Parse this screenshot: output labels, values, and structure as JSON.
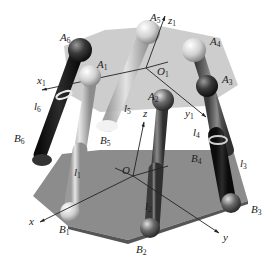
{
  "diagram": {
    "background": "#ffffff",
    "colors": {
      "top_platform": "#c9c9c9",
      "base_platform": "#8a8a8a",
      "dark_leg": "#1a1a1a",
      "mid_leg": "#5a5a5a",
      "light_leg": "#bdbdbd",
      "axis_line": "#222222"
    },
    "top_joints": [
      {
        "name": "A",
        "sub": "1"
      },
      {
        "name": "A",
        "sub": "2"
      },
      {
        "name": "A",
        "sub": "3"
      },
      {
        "name": "A",
        "sub": "4"
      },
      {
        "name": "A",
        "sub": "5"
      },
      {
        "name": "A",
        "sub": "6"
      }
    ],
    "base_joints": [
      {
        "name": "B",
        "sub": "1"
      },
      {
        "name": "B",
        "sub": "2"
      },
      {
        "name": "B",
        "sub": "3"
      },
      {
        "name": "B",
        "sub": "4"
      },
      {
        "name": "B",
        "sub": "5"
      },
      {
        "name": "B",
        "sub": "6"
      }
    ],
    "legs": [
      {
        "name": "l",
        "sub": "1"
      },
      {
        "name": "l",
        "sub": "2"
      },
      {
        "name": "l",
        "sub": "3"
      },
      {
        "name": "l",
        "sub": "4"
      },
      {
        "name": "l",
        "sub": "5"
      },
      {
        "name": "l",
        "sub": "6"
      }
    ],
    "moving_frame": {
      "origin": {
        "name": "O",
        "sub": "1"
      },
      "x": {
        "name": "x",
        "sub": "1"
      },
      "y": {
        "name": "y",
        "sub": "1"
      },
      "z": {
        "name": "z",
        "sub": "1"
      }
    },
    "fixed_frame": {
      "origin": {
        "name": "O"
      },
      "x": {
        "name": "x"
      },
      "y": {
        "name": "y"
      },
      "z": {
        "name": "z"
      }
    }
  }
}
